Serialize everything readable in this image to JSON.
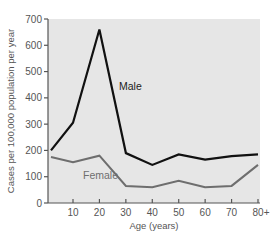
{
  "chart_data": {
    "type": "line",
    "title": "",
    "xlabel": "Age (years)",
    "ylabel": "Cases per 100,000 population per year",
    "x_tick_labels": [
      "10",
      "20",
      "30",
      "40",
      "50",
      "60",
      "70",
      "80+"
    ],
    "y_tick_labels": [
      "0",
      "100",
      "200",
      "300",
      "400",
      "500",
      "600",
      "700"
    ],
    "ylim": [
      0,
      700
    ],
    "grid": false,
    "legend_position": "inline labels",
    "x": [
      5,
      10,
      20,
      30,
      40,
      50,
      60,
      70,
      80
    ],
    "series": [
      {
        "name": "Male",
        "color": "#111111",
        "values": [
          200,
          305,
          660,
          190,
          145,
          185,
          165,
          178,
          185
        ]
      },
      {
        "name": "Female",
        "color": "#6e6e6e",
        "values": [
          175,
          155,
          180,
          65,
          60,
          85,
          60,
          65,
          145
        ]
      }
    ],
    "colors": {
      "plot_background": "#e6e6e6",
      "axis": "#555555",
      "text": "#555555"
    }
  }
}
